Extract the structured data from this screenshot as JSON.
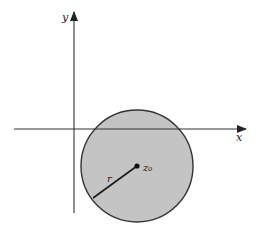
{
  "diagram": {
    "type": "complex-plane-disk",
    "axes": {
      "x_label": "x",
      "y_label": "y",
      "origin": [
        74,
        129
      ],
      "x_axis": {
        "from": 14,
        "to": 246,
        "y": 129
      },
      "y_axis": {
        "from": 213,
        "to": 12,
        "x": 74
      }
    },
    "disk": {
      "center": [
        137,
        166
      ],
      "radius": 56,
      "fill": "#c4c4c4",
      "stroke": "#333333",
      "center_label": "z₀",
      "radius_label": "r",
      "radius_end": [
        93,
        198
      ]
    },
    "colors": {
      "axis": "#333333",
      "background": "#ffffff"
    }
  }
}
